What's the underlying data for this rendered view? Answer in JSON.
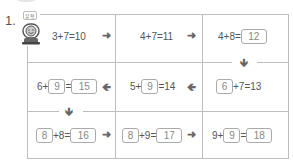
{
  "problem": {
    "number": "1.",
    "badge": "유형"
  },
  "grid": {
    "row1": [
      {
        "text": "3+7=10"
      },
      {
        "text": "4+7=11"
      },
      {
        "prefix": "4+8=",
        "answer": "12"
      }
    ],
    "row2": [
      {
        "prefix": "6+",
        "box1": "9",
        "mid": "=",
        "answer": "15"
      },
      {
        "prefix": "5+",
        "box1": "9",
        "suffix": "=14"
      },
      {
        "box1": "6",
        "suffix": "+7=13"
      }
    ],
    "row3": [
      {
        "box1": "8",
        "mid": "+8=",
        "answer": "16"
      },
      {
        "box1": "8",
        "mid": "+9=",
        "answer": "17"
      },
      {
        "prefix": "9+",
        "box1": "9",
        "mid": "=",
        "answer": "18"
      }
    ]
  },
  "arrows": {
    "right": "➜",
    "left": "🡸",
    "down": "🡻"
  },
  "colors": {
    "line": "#bdbdbd",
    "text": "#555555"
  }
}
